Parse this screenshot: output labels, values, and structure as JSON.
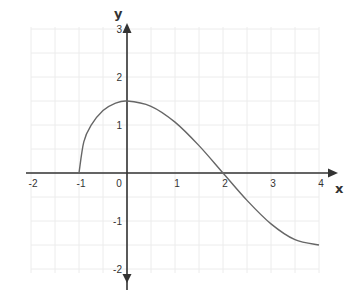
{
  "chart_data": {
    "type": "line",
    "title": "",
    "xlabel": "x",
    "ylabel": "y",
    "xlim": [
      -2,
      4
    ],
    "ylim": [
      -2,
      3
    ],
    "grid": true,
    "grid_step": 0.5,
    "x_ticks": [
      -2,
      -1,
      0,
      1,
      2,
      3,
      4
    ],
    "x_tick_labels": [
      "-2",
      "-1",
      "0",
      "1",
      "2",
      "3",
      "4"
    ],
    "y_ticks": [
      -2,
      -1,
      1,
      2,
      3
    ],
    "y_tick_labels": [
      "-2",
      "-1",
      "1",
      "2",
      "3"
    ],
    "series": [
      {
        "name": "f(x)",
        "x": [
          -1,
          -0.9,
          -0.75,
          -0.5,
          -0.25,
          0,
          0.5,
          1,
          1.5,
          2,
          2.5,
          3,
          3.5,
          4
        ],
        "y": [
          0,
          0.65,
          0.99,
          1.3,
          1.45,
          1.5,
          1.39,
          1.06,
          0.57,
          0,
          -0.57,
          -1.06,
          -1.39,
          -1.5
        ]
      }
    ],
    "key_points": {
      "start": [
        -1,
        0
      ],
      "maximum": [
        0,
        1.5
      ],
      "x_intercept": [
        2,
        0
      ],
      "end": [
        4,
        -1.5
      ]
    }
  },
  "colors": {
    "axis": "#333333",
    "curve": "#666666",
    "grid": "#ececec"
  }
}
